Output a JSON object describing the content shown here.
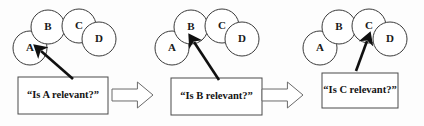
{
  "figure": {
    "background_color": "#fdfdfd",
    "width": 424,
    "height": 126,
    "node_stroke_color": "#3a3a3a",
    "box_stroke_color": "#4a4a4a",
    "pointer_color": "#101010",
    "flow_arrow_stroke": "#6a6a6a"
  },
  "panels": [
    {
      "id": "panel-1",
      "query": "“Is A relevant?”",
      "highlighted_node": "A",
      "nodes": [
        {
          "label": "A",
          "cx": 30,
          "cy": 48,
          "r": 17
        },
        {
          "label": "B",
          "cx": 48,
          "cy": 27,
          "r": 17
        },
        {
          "label": "C",
          "cx": 79,
          "cy": 26,
          "r": 17
        },
        {
          "label": "D",
          "cx": 99,
          "cy": 39,
          "r": 17
        }
      ],
      "box": {
        "x": 18,
        "y": 77,
        "w": 90,
        "h": 37
      },
      "pointer": {
        "x1": 73,
        "y1": 79,
        "x2": 41,
        "y2": 51
      }
    },
    {
      "id": "panel-2",
      "query": "“Is B relevant?”",
      "highlighted_node": "B",
      "nodes": [
        {
          "label": "A",
          "cx": 172,
          "cy": 48,
          "r": 17
        },
        {
          "label": "B",
          "cx": 191,
          "cy": 27,
          "r": 17
        },
        {
          "label": "C",
          "cx": 222,
          "cy": 26,
          "r": 17
        },
        {
          "label": "D",
          "cx": 242,
          "cy": 39,
          "r": 17
        }
      ],
      "box": {
        "x": 171,
        "y": 78,
        "w": 91,
        "h": 37
      },
      "pointer": {
        "x1": 219,
        "y1": 80,
        "x2": 194,
        "y2": 42
      }
    },
    {
      "id": "panel-3",
      "query": "“Is C relevant?”",
      "highlighted_node": "C",
      "nodes": [
        {
          "label": "A",
          "cx": 320,
          "cy": 48,
          "r": 17
        },
        {
          "label": "B",
          "cx": 339,
          "cy": 27,
          "r": 17
        },
        {
          "label": "C",
          "cx": 369,
          "cy": 26,
          "r": 17
        },
        {
          "label": "D",
          "cx": 390,
          "cy": 39,
          "r": 17
        }
      ],
      "box": {
        "x": 322,
        "y": 73,
        "w": 76,
        "h": 35
      },
      "pointer": {
        "x1": 356,
        "y1": 71,
        "x2": 367,
        "y2": 41
      }
    }
  ],
  "flow_arrows": [
    {
      "id": "flow-arrow-1",
      "x": 112,
      "y": 82,
      "w": 41,
      "h": 26
    },
    {
      "id": "flow-arrow-2",
      "x": 262,
      "y": 82,
      "w": 41,
      "h": 26
    }
  ],
  "chart_data": {
    "type": "diagram",
    "node_labels": [
      "A",
      "B",
      "C",
      "D"
    ],
    "steps": [
      {
        "step": 1,
        "query": "“Is A relevant?”",
        "target_node": "A"
      },
      {
        "step": 2,
        "query": "“Is B relevant?”",
        "target_node": "B"
      },
      {
        "step": 3,
        "query": "“Is C relevant?”",
        "target_node": "C"
      }
    ],
    "transitions": [
      "step 1 → step 2",
      "step 2 → step 3"
    ]
  }
}
